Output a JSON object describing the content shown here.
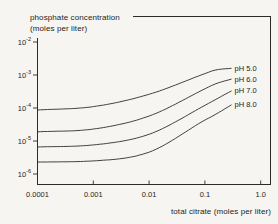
{
  "chart": {
    "title_line1": "phosphate concentration",
    "title_line2": "(moles per liter)",
    "x_axis_title": "total citrate (moles per liter)"
  },
  "chart_data": {
    "type": "line",
    "title": "",
    "xlabel": "total citrate (moles per liter)",
    "ylabel": "phosphate concentration (moles per liter)",
    "x_scale": "log",
    "y_scale": "log",
    "xlim": [
      0.0001,
      1.6
    ],
    "ylim": [
      4.6e-07,
      0.057
    ],
    "grid": false,
    "legend_position": "inline-right",
    "line_color": "#2e2e2e",
    "x_ticks": [
      {
        "value": 0.0001,
        "label": "0.0001"
      },
      {
        "value": 0.001,
        "label": "0.001"
      },
      {
        "value": 0.01,
        "label": "0.01"
      },
      {
        "value": 0.1,
        "label": "0.1"
      },
      {
        "value": 1.0,
        "label": "1.0"
      }
    ],
    "y_ticks": [
      {
        "value": 0.01,
        "label": "10^-2"
      },
      {
        "value": 0.001,
        "label": "10^-3"
      },
      {
        "value": 0.0001,
        "label": "10^-4"
      },
      {
        "value": 1e-05,
        "label": "10^-5"
      },
      {
        "value": 1e-06,
        "label": "10^-6"
      }
    ],
    "series": [
      {
        "name": "pH 5.0",
        "x": [
          0.0001,
          0.001,
          0.01,
          0.1,
          0.15,
          0.3
        ],
        "y": [
          8.7e-05,
          0.00011,
          0.00026,
          0.0011,
          0.0014,
          0.0016
        ]
      },
      {
        "name": "pH 6.0",
        "x": [
          0.0001,
          0.001,
          0.01,
          0.1,
          0.15,
          0.3
        ],
        "y": [
          1.9e-05,
          2.3e-05,
          5.7e-05,
          0.00038,
          0.00053,
          0.00075
        ]
      },
      {
        "name": "pH 7.0",
        "x": [
          0.0001,
          0.001,
          0.01,
          0.1,
          0.15,
          0.3
        ],
        "y": [
          6.6e-06,
          7.6e-06,
          1.6e-05,
          0.00012,
          0.000175,
          0.00033
        ]
      },
      {
        "name": "pH 8.0",
        "x": [
          0.0001,
          0.001,
          0.01,
          0.1,
          0.15,
          0.3
        ],
        "y": [
          2.3e-06,
          2.5e-06,
          4.6e-06,
          4.3e-05,
          6.2e-05,
          0.000125
        ]
      }
    ]
  }
}
